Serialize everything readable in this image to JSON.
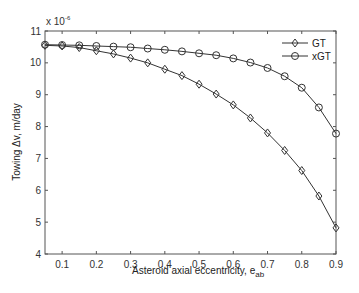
{
  "chart_data": {
    "type": "line",
    "title": "",
    "xlabel": "Asteroid axial eccentricity, e",
    "xlabel_sub": "ab",
    "ylabel": "Towing Δv, m/day",
    "y_multiplier": "x 10",
    "y_multiplier_exp": "-6",
    "xlim": [
      0.05,
      0.9
    ],
    "ylim": [
      4,
      11
    ],
    "xticks": [
      0.1,
      0.2,
      0.3,
      0.4,
      0.5,
      0.6,
      0.7,
      0.8,
      0.9
    ],
    "xtick_labels": [
      "0.1",
      "0.2",
      "0.3",
      "0.4",
      "0.5",
      "0.6",
      "0.7",
      "0.8",
      "0.9"
    ],
    "yticks": [
      4,
      5,
      6,
      7,
      8,
      9,
      10,
      11
    ],
    "ytick_labels": [
      "4",
      "5",
      "6",
      "7",
      "8",
      "9",
      "10",
      "11"
    ],
    "grid": false,
    "legend_position": "upper right",
    "x": [
      0.05,
      0.1,
      0.15,
      0.2,
      0.25,
      0.3,
      0.35,
      0.4,
      0.45,
      0.5,
      0.55,
      0.6,
      0.65,
      0.7,
      0.75,
      0.8,
      0.85,
      0.9
    ],
    "series": [
      {
        "name": "GT",
        "marker": "diamond",
        "values": [
          10.55,
          10.53,
          10.48,
          10.38,
          10.28,
          10.15,
          10.0,
          9.8,
          9.6,
          9.33,
          9.02,
          8.68,
          8.27,
          7.8,
          7.25,
          6.62,
          5.82,
          4.82
        ]
      },
      {
        "name": "xGT",
        "marker": "circle",
        "values": [
          10.57,
          10.56,
          10.55,
          10.53,
          10.51,
          10.49,
          10.45,
          10.41,
          10.36,
          10.3,
          10.24,
          10.14,
          10.01,
          9.84,
          9.58,
          9.22,
          8.6,
          7.78
        ]
      }
    ]
  },
  "colors": {
    "line": "#333333",
    "axis": "#555555",
    "background": "#ffffff"
  }
}
